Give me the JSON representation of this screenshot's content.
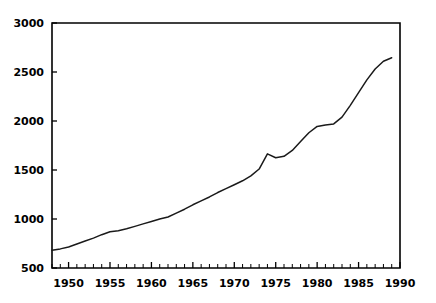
{
  "chart_data": {
    "type": "line",
    "title": "",
    "subtitle": "",
    "xlabel": "",
    "ylabel": "",
    "xlim": [
      1948,
      1990
    ],
    "ylim": [
      500,
      3000
    ],
    "grid": false,
    "legend": false,
    "legend_position": "none",
    "x_ticks_major": [
      1950,
      1955,
      1960,
      1965,
      1970,
      1975,
      1980,
      1985,
      1990
    ],
    "x_tick_labels": [
      "1950",
      "1955",
      "1960",
      "1965",
      "1970",
      "1975",
      "1980",
      "1985",
      "1990"
    ],
    "x_minor_tick_interval": 1,
    "y_ticks_major": [
      500,
      1000,
      1500,
      2000,
      2500,
      3000
    ],
    "y_tick_labels": [
      "500",
      "1000",
      "1500",
      "2000",
      "2500",
      "3000"
    ],
    "line_color": "#1a1a1a",
    "axis_color": "#000000",
    "background_color": "#ffffff",
    "series": [
      {
        "name": "series-1",
        "color": "#1a1a1a",
        "x": [
          1948,
          1949,
          1950,
          1951,
          1952,
          1953,
          1954,
          1955,
          1956,
          1957,
          1958,
          1959,
          1960,
          1961,
          1962,
          1963,
          1964,
          1965,
          1966,
          1967,
          1968,
          1969,
          1970,
          1971,
          1972,
          1973,
          1974,
          1975,
          1976,
          1977,
          1978,
          1979,
          1980,
          1981,
          1982,
          1983,
          1984,
          1985,
          1986,
          1987,
          1988,
          1989
        ],
        "values": [
          680,
          695,
          715,
          745,
          775,
          805,
          840,
          870,
          880,
          900,
          925,
          950,
          975,
          1000,
          1020,
          1060,
          1100,
          1145,
          1185,
          1225,
          1270,
          1310,
          1350,
          1390,
          1440,
          1510,
          1665,
          1625,
          1640,
          1700,
          1790,
          1880,
          1945,
          1960,
          1970,
          2040,
          2160,
          2290,
          2420,
          2530,
          2610,
          2645
        ]
      }
    ]
  }
}
